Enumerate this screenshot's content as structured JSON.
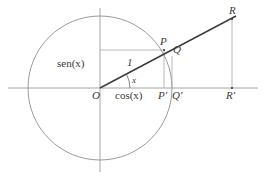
{
  "figure": {
    "type": "geometry-diagram",
    "colors": {
      "axis": "#9a9a9a",
      "circle": "#8f8f8f",
      "ray": "#3d3d3d",
      "helper": "#a8a8a8",
      "label": "#3a3a3a",
      "background": "#ffffff"
    },
    "geometry": {
      "origin": {
        "x": 100,
        "y": 88
      },
      "radius": 72,
      "angle_deg": 28,
      "x_axis": {
        "x1": 8,
        "y1": 88,
        "x2": 258,
        "y2": 88
      },
      "y_axis": {
        "x1": 100,
        "y1": 8,
        "x2": 100,
        "y2": 172
      },
      "points": {
        "O": {
          "x": 100,
          "y": 88
        },
        "P": {
          "x": 164,
          "y": 50
        },
        "Q": {
          "x": 172,
          "y": 56
        },
        "R": {
          "x": 232,
          "y": 19
        },
        "P_prime": {
          "x": 164,
          "y": 88
        },
        "Q_prime": {
          "x": 172,
          "y": 88
        },
        "R_prime": {
          "x": 232,
          "y": 88
        }
      }
    },
    "labels": {
      "origin": "O",
      "point_p": "P",
      "point_q": "Q",
      "point_r": "R",
      "point_p_prime": "P'",
      "point_q_prime": "Q'",
      "point_r_prime": "R'",
      "sine": "sen(x)",
      "cosine": "cos(x)",
      "radius_one": "1",
      "angle": "x"
    }
  }
}
